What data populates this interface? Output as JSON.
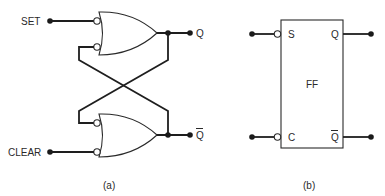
{
  "figure_a": {
    "caption": "(a)",
    "inputs": {
      "set_label": "SET",
      "clear_label": "CLEAR"
    },
    "outputs": {
      "q_label": "Q",
      "qbar_label": "Q"
    },
    "gates": [
      {
        "type": "OR",
        "inverted_inputs": 2,
        "role": "upper-gate"
      },
      {
        "type": "OR",
        "inverted_inputs": 2,
        "role": "lower-gate"
      }
    ],
    "connection": "cross-coupled feedback"
  },
  "figure_b": {
    "caption": "(b)",
    "block_label": "FF",
    "pins": {
      "s_label": "S",
      "c_label": "C",
      "q_label": "Q",
      "qbar_label": "Q"
    }
  },
  "colors": {
    "line": "#1e1e1e",
    "background": "#ffffff"
  }
}
